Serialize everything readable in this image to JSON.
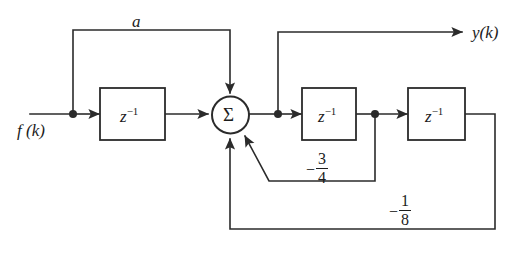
{
  "diagram": {
    "kind": "discrete-time-block-diagram",
    "width": 521,
    "height": 263,
    "background_color": "#ffffff",
    "line_color": "#2b2b2b",
    "text_color": "#1c1c1c",
    "input_label": "f (k)",
    "output_label": "y(k)",
    "summing_junction_symbol": "Σ",
    "blocks": [
      {
        "id": "delay-1",
        "label_base": "z",
        "label_exponent": "−1"
      },
      {
        "id": "delay-2",
        "label_base": "z",
        "label_exponent": "−1"
      },
      {
        "id": "delay-3",
        "label_base": "z",
        "label_exponent": "−1"
      }
    ],
    "gains": [
      {
        "id": "feedforward-gain-a",
        "label": "a",
        "sign": "",
        "numerator": "",
        "denominator": "",
        "path": "input-node to summing-junction"
      },
      {
        "id": "feedback-gain-three-quarters",
        "label": "−3/4",
        "sign": "−",
        "numerator": "3",
        "denominator": "4",
        "path": "delay-2 output to summing-junction"
      },
      {
        "id": "feedback-gain-one-eighth",
        "label": "−1/8",
        "sign": "−",
        "numerator": "1",
        "denominator": "8",
        "path": "delay-3 output to summing-junction"
      }
    ]
  }
}
